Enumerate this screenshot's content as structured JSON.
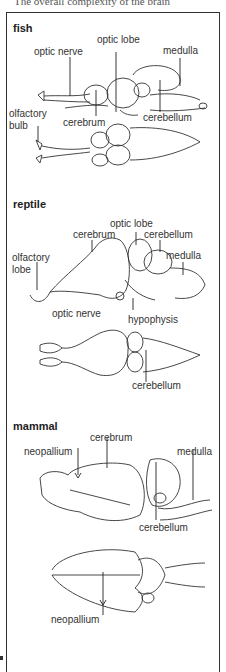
{
  "caption": "The overall complexity of the brain",
  "sections": [
    {
      "name": "fish",
      "labels": [
        "optic lobe",
        "optic nerve",
        "medulla",
        "olfactory",
        "bulb",
        "cerebrum",
        "cerebellum"
      ]
    },
    {
      "name": "reptile",
      "labels": [
        "optic lobe",
        "cerebrum",
        "cerebellum",
        "olfactory",
        "lobe",
        "medulla",
        "optic nerve",
        "hypophysis",
        "cerebellum"
      ]
    },
    {
      "name": "mammal",
      "labels": [
        "cerebrum",
        "neopallium",
        "medulla",
        "cerebellum",
        "neopallium"
      ]
    }
  ],
  "colors": {
    "ink": "#222222",
    "frame": "#333333",
    "background": "#ffffff"
  }
}
